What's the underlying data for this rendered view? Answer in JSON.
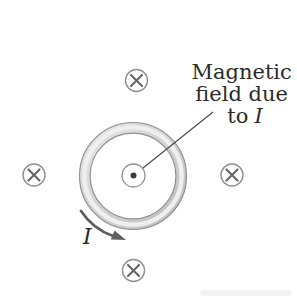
{
  "figure": {
    "type": "physics-diagram",
    "annotation": {
      "line1": "Magnetic",
      "line2": "field due",
      "line3_prefix": "to",
      "line3_symbol": "I"
    },
    "current_label": "I",
    "symbols": {
      "out_of_page": "circled-dot (field out of page, at loop center)",
      "into_page": "circled-x (field into page)",
      "into_page_count": 4,
      "into_page_positions": [
        "top",
        "left",
        "right",
        "bottom"
      ]
    },
    "colors": {
      "background": "#ffffff",
      "text": "#2b2b2b",
      "ring_band_light": "#e6e6e6",
      "ring_band_dark": "#bdbdbd",
      "ring_highlight": "#efefef",
      "ring_outline": "#8f8f8f",
      "symbol_circle": "#8f8f8f",
      "symbol_x": "#686868",
      "arrow": "#5f5f5f",
      "leader_line": "#4a4a4a",
      "dot": "#3a3a3a"
    }
  }
}
